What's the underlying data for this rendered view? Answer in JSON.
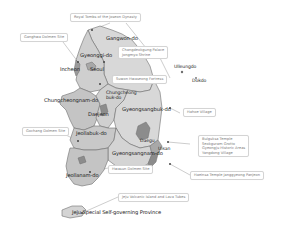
{
  "map": {
    "title": "UNESCO World Heritage Sites of South Korea (map)",
    "colors": {
      "land_light": "#d8d8d8",
      "land_mid": "#c4c4c4",
      "land_dark": "#9a9a9a",
      "border": "#6f6f6f",
      "callout_border": "#d4d4d4",
      "callout_text": "#7a7a7a",
      "leader_line": "#9a9a9a"
    },
    "regions": [
      {
        "id": "gangwon",
        "label": "Gangwon-do"
      },
      {
        "id": "gyeonggi",
        "label": "Gyeonggi-do"
      },
      {
        "id": "incheon",
        "label": "Incheon"
      },
      {
        "id": "seoul",
        "label": "Seoul"
      },
      {
        "id": "chungnam",
        "label": "Chungcheongnam-do"
      },
      {
        "id": "chungbuk",
        "label": "Chungcheong\nbuk-do"
      },
      {
        "id": "daejeon",
        "label": "Daejeon"
      },
      {
        "id": "gyeongbuk",
        "label": "Gyeongsangbuk-do"
      },
      {
        "id": "jeonbuk",
        "label": "Jeollabuk-do"
      },
      {
        "id": "daegu",
        "label": "Daegu"
      },
      {
        "id": "ulsan",
        "label": "Ulsan"
      },
      {
        "id": "gyeongnam",
        "label": "Gyeongsangnam-do"
      },
      {
        "id": "jeonnam",
        "label": "Jeollanam-do"
      },
      {
        "id": "jeju",
        "label": "Jeju Special Self-governing Province"
      },
      {
        "id": "ulleungdo",
        "label": "Ulleungdo"
      },
      {
        "id": "dokdo",
        "label": "Dokdo"
      }
    ],
    "callouts": [
      {
        "id": "royal-tombs",
        "text": "Royal Tombs of the Joseon Dynasty"
      },
      {
        "id": "ganghwa-dolmen",
        "text": "Ganghwa Dolmen Site"
      },
      {
        "id": "changdeokgung",
        "lines": [
          "Changdeokgung Palace",
          "Jongmyo Shrine"
        ]
      },
      {
        "id": "hwaseong",
        "text": "Suwon Hwaseong Fortress"
      },
      {
        "id": "hahoe",
        "text": "Hahoe Village"
      },
      {
        "id": "gochang-dolmen",
        "text": "Gochang Dolmen Site"
      },
      {
        "id": "gyeongju",
        "lines": [
          "Bulguksa Temple",
          "Seokguram Grotto",
          "Gyeongju Historic Areas",
          "Yangdong Village"
        ]
      },
      {
        "id": "haeinsa",
        "text": "Haeinsa Temple Janggyeong Panjeon"
      },
      {
        "id": "hwasun-dolmen",
        "text": "Hwasun Dolmen Site"
      },
      {
        "id": "jeju-volcanic",
        "text": "Jeju Volcanic Island and Lava Tubes"
      }
    ]
  }
}
